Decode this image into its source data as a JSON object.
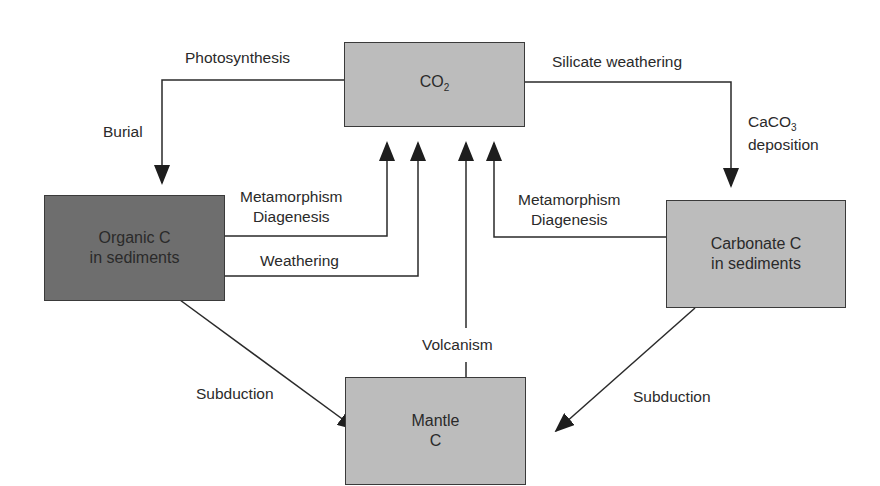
{
  "diagram": {
    "colors": {
      "light_box": "#bcbcbc",
      "dark_box": "#6e6e6e",
      "line": "#2a2a2a"
    },
    "nodes": {
      "co2": {
        "main": "CO",
        "sub": "2"
      },
      "organic": {
        "line1": "Organic C",
        "line2": "in sediments"
      },
      "carbonate": {
        "line1": "Carbonate C",
        "line2": "in sediments"
      },
      "mantle": {
        "line1": "Mantle",
        "line2": "C"
      }
    },
    "edges": {
      "photosynthesis": "Photosynthesis",
      "burial": "Burial",
      "silicate_weathering": "Silicate weathering",
      "caco3_main": "CaCO",
      "caco3_sub": "3",
      "deposition": "deposition",
      "organic_meta_1": "Metamorphism",
      "organic_meta_2": "Diagenesis",
      "weathering": "Weathering",
      "carbonate_meta_1": "Metamorphism",
      "carbonate_meta_2": "Diagenesis",
      "volcanism": "Volcanism",
      "subduction_left": "Subduction",
      "subduction_right": "Subduction"
    }
  }
}
